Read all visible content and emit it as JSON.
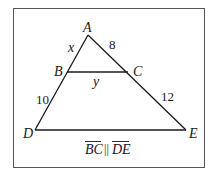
{
  "diagram": {
    "type": "geometry-triangle",
    "vertices": {
      "A": {
        "label": "A"
      },
      "B": {
        "label": "B"
      },
      "C": {
        "label": "C"
      },
      "D": {
        "label": "D"
      },
      "E": {
        "label": "E"
      }
    },
    "segments": {
      "AB": {
        "label": "x"
      },
      "AC": {
        "label": "8"
      },
      "BC": {
        "label": "y"
      },
      "BD": {
        "label": "10"
      },
      "CE": {
        "label": "12"
      }
    },
    "caption": {
      "seg1": "BC",
      "symbol": "||",
      "seg2": "DE"
    }
  }
}
